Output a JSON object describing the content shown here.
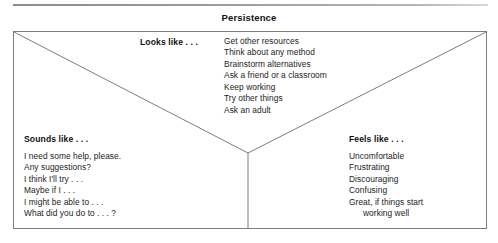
{
  "title": "Persistence",
  "diagram": {
    "type": "y-chart",
    "sections": [
      {
        "id": "looks",
        "heading": "Looks like . . .",
        "items": [
          "Get other resources",
          "Think about any method",
          "Brainstorm alternatives",
          "Ask a friend or a classroom",
          "Keep working",
          "Try other things",
          "Ask an adult"
        ]
      },
      {
        "id": "sounds",
        "heading": "Sounds like . . .",
        "items": [
          "I need some help, please.",
          "Any suggestions?",
          "I think I'll try . . .",
          "Maybe if I . . .",
          "I might be able to . . .",
          "What did you do to . . . ?"
        ]
      },
      {
        "id": "feels",
        "heading": "Feels like . . .",
        "items": [
          "Uncomfortable",
          "Frustrating",
          "Discouraging",
          "Confusing",
          "Great, if things start",
          "working well"
        ]
      }
    ]
  },
  "colors": {
    "line": "#7d7d7d",
    "text": "#1c1c1c",
    "heading": "#121212",
    "background": "#ffffff"
  }
}
